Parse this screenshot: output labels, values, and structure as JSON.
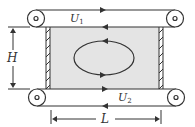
{
  "diagram": {
    "labels": {
      "top_velocity": "U",
      "top_velocity_sub": "1",
      "bottom_velocity": "U",
      "bottom_velocity_sub": "2",
      "height": "H",
      "length": "L"
    },
    "colors": {
      "stroke": "#333333",
      "cavity_fill": "#e4e4e4",
      "background": "#ffffff"
    },
    "elements": [
      "top-belt with two rollers, upper run moving right, lower run moving left",
      "bottom-belt with two rollers, upper run moving right, lower run moving left",
      "cavity (shaded) between hatched side walls",
      "recirculating vortex (counter-clockwise arrows)",
      "height dimension H",
      "length dimension L"
    ]
  }
}
